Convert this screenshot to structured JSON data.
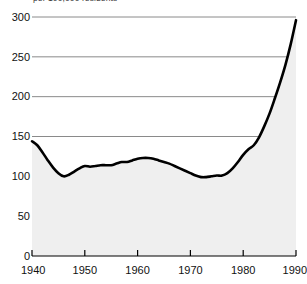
{
  "chart_data": {
    "type": "line",
    "title": "",
    "subtitle": "",
    "axis_note": "per 100,000 residents",
    "xlabel": "",
    "ylabel": "",
    "xlim": [
      1940,
      1990
    ],
    "ylim": [
      0,
      300
    ],
    "grid": true,
    "grid_axis": "y",
    "legend": "none",
    "fill_below": true,
    "fill_color": "#efefef",
    "line_color": "#000000",
    "grid_color": "#8a8a8a",
    "axis_color": "#000000",
    "background_color": "#ffffff",
    "y_ticks": [
      0,
      50,
      100,
      150,
      200,
      250,
      300
    ],
    "y_tick_labels": [
      "0",
      "50",
      "100",
      "150",
      "200",
      "250",
      "300"
    ],
    "x_ticks": [
      1940,
      1950,
      1960,
      1970,
      1980,
      1990
    ],
    "x_tick_labels": [
      "1940",
      "1950",
      "1960",
      "1970",
      "1980",
      "1990"
    ],
    "x": [
      1940,
      1941,
      1942,
      1943,
      1944,
      1945,
      1946,
      1947,
      1948,
      1949,
      1950,
      1951,
      1952,
      1953,
      1954,
      1955,
      1956,
      1957,
      1958,
      1959,
      1960,
      1961,
      1962,
      1963,
      1964,
      1965,
      1966,
      1967,
      1968,
      1969,
      1970,
      1971,
      1972,
      1973,
      1974,
      1975,
      1976,
      1977,
      1978,
      1979,
      1980,
      1981,
      1982,
      1983,
      1984,
      1985,
      1986,
      1987,
      1988,
      1989,
      1990
    ],
    "values": [
      144,
      139,
      130,
      120,
      111,
      104,
      100,
      102,
      106,
      110,
      113,
      112,
      113,
      114,
      114,
      114,
      116,
      118,
      118,
      120,
      122,
      123,
      123,
      122,
      120,
      118,
      116,
      113,
      110,
      107,
      104,
      101,
      99,
      99,
      100,
      101,
      101,
      104,
      110,
      118,
      127,
      134,
      139,
      149,
      163,
      179,
      198,
      218,
      240,
      266,
      296
    ]
  }
}
